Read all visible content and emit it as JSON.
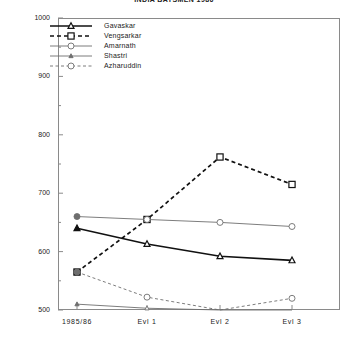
{
  "chart_data": {
    "type": "line",
    "title": "INDIA BATSMEN 1986",
    "xlabel": "",
    "ylabel": "",
    "ylim": [
      500,
      1000
    ],
    "grid": false,
    "legend_position": "top-left-inside",
    "categories": [
      "1985/86",
      "Evl 1",
      "Evl 2",
      "Evl 3"
    ],
    "ytick_labels": [
      "500",
      "600",
      "700",
      "800",
      "900",
      "1000"
    ],
    "ytick_values": [
      500,
      600,
      700,
      800,
      900,
      1000
    ],
    "yminor_values": [
      550,
      650,
      750,
      850,
      950
    ],
    "series": [
      {
        "name": "Gavaskar",
        "marker": "triangle-open",
        "line_style": "solid",
        "line_width": "thick",
        "values": [
          640,
          613,
          592,
          585
        ]
      },
      {
        "name": "Vengsarkar",
        "marker": "square-open",
        "line_style": "dashed",
        "line_width": "thick",
        "values": [
          565,
          655,
          762,
          715
        ]
      },
      {
        "name": "Amarnath",
        "marker": "circle-open",
        "line_style": "solid",
        "line_width": "thin",
        "values": [
          660,
          655,
          650,
          643
        ]
      },
      {
        "name": "Shastri",
        "marker": "triangle-small",
        "line_style": "solid",
        "line_width": "thin",
        "values": [
          510,
          503,
          500,
          500
        ]
      },
      {
        "name": "Azharuddin",
        "marker": "circle-open",
        "line_style": "dashed",
        "line_width": "thin",
        "values": [
          565,
          522,
          500,
          520
        ]
      }
    ]
  },
  "legend": {
    "items": [
      {
        "label": "Gavaskar"
      },
      {
        "label": "Vengsarkar"
      },
      {
        "label": "Amarnath"
      },
      {
        "label": "Shastri"
      },
      {
        "label": "Azharuddin"
      }
    ]
  },
  "colors": {
    "axis": "#8a8a8a",
    "ink": "#111111",
    "thin": "#6e6e6e",
    "background": "#ffffff"
  }
}
